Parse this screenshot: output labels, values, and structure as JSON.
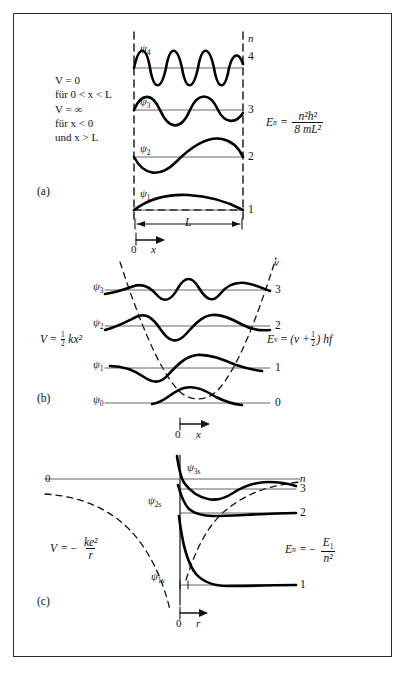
{
  "figure": {
    "type": "physics-diagram",
    "panels": [
      {
        "tag": "(a)",
        "system": "infinite-square-well",
        "potential_lines": [
          "V = 0",
          "für 0 < x < L",
          "V = ∞",
          "für x < 0",
          "und x > L"
        ],
        "energy_formula": {
          "lhs": "E",
          "lhs_sub": "n",
          "eq": "=",
          "numerator": "n²h²",
          "denominator": "8 mL²"
        },
        "quantum_axis_label": "n",
        "levels": [
          {
            "n": "4",
            "psi": "ψ",
            "psi_sub": "4"
          },
          {
            "n": "3",
            "psi": "ψ",
            "psi_sub": "3"
          },
          {
            "n": "2",
            "psi": "ψ",
            "psi_sub": "2"
          },
          {
            "n": "1",
            "psi": "ψ",
            "psi_sub": "1"
          }
        ],
        "width_label": "L",
        "x_axis_label": "x",
        "origin_label": "0"
      },
      {
        "tag": "(b)",
        "system": "harmonic-oscillator",
        "potential_formula": {
          "lhs": "V",
          "eq": "=",
          "coefficient_num": "1",
          "coefficient_den": "2",
          "rest": "kx²"
        },
        "energy_formula": {
          "lhs": "E",
          "lhs_sub": "v",
          "eq": "=",
          "expr_open": "(v +",
          "frac_num": "1",
          "frac_den": "2",
          "expr_close": ") hf"
        },
        "quantum_axis_label": "v",
        "levels": [
          {
            "n": "3",
            "psi": "ψ",
            "psi_sub": "3"
          },
          {
            "n": "2",
            "psi": "ψ",
            "psi_sub": "2"
          },
          {
            "n": "1",
            "psi": "ψ",
            "psi_sub": "1"
          },
          {
            "n": "0",
            "psi": "ψ",
            "psi_sub": "0"
          }
        ],
        "x_axis_label": "x",
        "origin_label": "0"
      },
      {
        "tag": "(c)",
        "system": "hydrogen-atom",
        "potential_formula": {
          "lhs": "V",
          "eq": "= −",
          "numerator": "ke²",
          "denominator": "r"
        },
        "energy_formula": {
          "lhs": "E",
          "lhs_sub": "n",
          "eq": "= −",
          "numerator": "E",
          "numerator_sub": "1",
          "denominator": "n²"
        },
        "quantum_axis_label": "n",
        "zero_label": "0",
        "levels": [
          {
            "n": "3",
            "psi": "ψ",
            "psi_sub": "3s"
          },
          {
            "n": "2",
            "psi": "ψ",
            "psi_sub": "2s"
          },
          {
            "n": "1",
            "psi": "ψ",
            "psi_sub": "1s"
          }
        ],
        "r_axis_label": "r",
        "origin_label": "0"
      }
    ]
  },
  "colors": {
    "ink": "#111111",
    "frame": "#2b2b2b",
    "wave": "#000000",
    "baseline": "#444444",
    "dashed": "#111111",
    "paper": "#ffffff"
  }
}
